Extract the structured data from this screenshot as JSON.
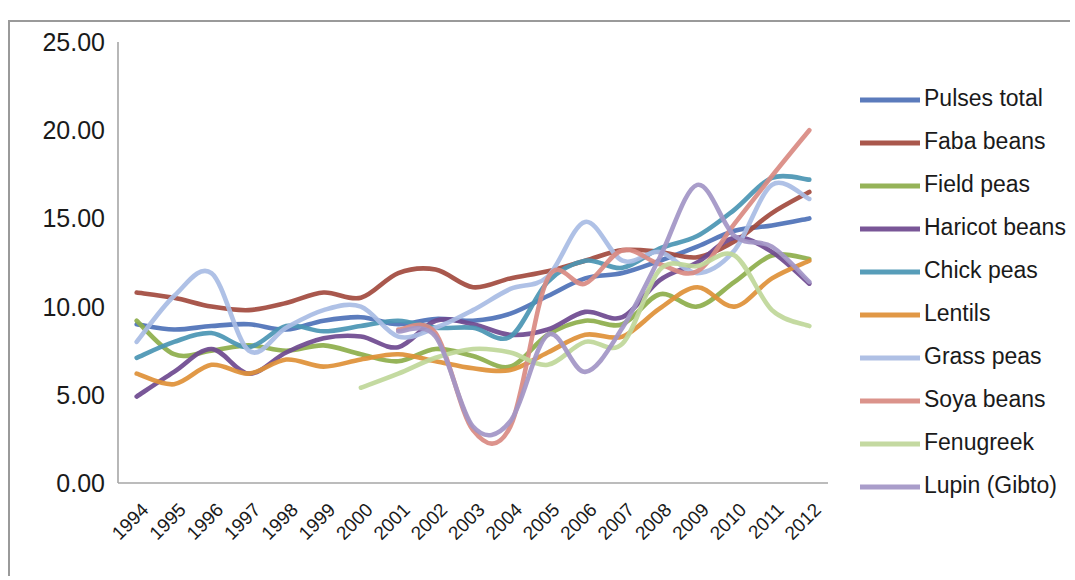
{
  "chart_data": {
    "type": "line",
    "title": "",
    "subtitle": "",
    "xlabel": "",
    "ylabel": "",
    "grid": false,
    "legend_position": "right",
    "ylim": [
      0,
      25
    ],
    "ytick_labels": [
      "0.00",
      "5.00",
      "10.00",
      "15.00",
      "20.00",
      "25.00"
    ],
    "ytick_values": [
      0,
      5,
      10,
      15,
      20,
      25
    ],
    "categories": [
      "1994",
      "1995",
      "1996",
      "1997",
      "1998",
      "1999",
      "2000",
      "2001",
      "2002",
      "2003",
      "2004",
      "2005",
      "2006",
      "2007",
      "2008",
      "2009",
      "2010",
      "2011",
      "2012"
    ],
    "series": [
      {
        "name": "Pulses total",
        "color": "#4f72b8",
        "values": [
          9.0,
          8.7,
          8.9,
          9.0,
          8.7,
          9.2,
          9.4,
          9.0,
          9.3,
          9.2,
          9.6,
          10.6,
          11.6,
          11.9,
          12.6,
          13.4,
          14.3,
          14.6,
          15.0
        ]
      },
      {
        "name": "Faba beans",
        "color": "#a34b3f",
        "values": [
          10.8,
          10.5,
          10.0,
          9.8,
          10.2,
          10.8,
          10.5,
          11.9,
          12.1,
          11.1,
          11.6,
          12.0,
          12.6,
          13.2,
          13.1,
          12.8,
          13.7,
          15.3,
          16.5
        ]
      },
      {
        "name": "Field peas",
        "color": "#8eae4c",
        "values": [
          9.2,
          7.3,
          7.5,
          7.8,
          7.5,
          7.8,
          7.3,
          6.9,
          7.6,
          7.2,
          6.6,
          8.4,
          9.2,
          9.0,
          10.7,
          10.0,
          11.4,
          12.9,
          12.7
        ]
      },
      {
        "name": "Haricot beans",
        "color": "#6f4a90"
      },
      {
        "name": "Chick peas",
        "color": "#4b96b4"
      },
      {
        "name": "Lentils",
        "color": "#df9139"
      },
      {
        "name": "Grass peas",
        "color": "#a9bce4"
      },
      {
        "name": "Soya beans",
        "color": "#d98b83"
      },
      {
        "name": "Fenugreek",
        "color": "#c0d79a"
      },
      {
        "name": "Lupin (Gibto)",
        "color": "#a396c6"
      }
    ],
    "series_values": {
      "Haricot beans": [
        4.9,
        6.3,
        7.6,
        6.2,
        7.4,
        8.2,
        8.3,
        7.7,
        9.2,
        9.0,
        8.4,
        8.7,
        9.7,
        9.4,
        11.5,
        12.5,
        13.9,
        13.1,
        11.3
      ],
      "Chick peas": [
        7.1,
        8.0,
        8.5,
        7.7,
        8.9,
        8.6,
        8.9,
        9.2,
        8.8,
        8.8,
        8.3,
        11.4,
        12.6,
        12.2,
        13.3,
        14.0,
        15.5,
        17.3,
        17.2
      ],
      "Lentils": [
        6.2,
        5.6,
        6.7,
        6.2,
        7.0,
        6.6,
        7.0,
        7.3,
        6.9,
        6.5,
        6.4,
        7.4,
        8.4,
        8.3,
        9.9,
        11.1,
        10.0,
        11.6,
        12.6
      ],
      "Grass peas": [
        8.0,
        10.6,
        11.9,
        7.5,
        8.8,
        9.8,
        10.0,
        8.3,
        8.8,
        9.8,
        11.0,
        11.7,
        14.8,
        12.6,
        13.1,
        11.9,
        13.2,
        16.9,
        16.1
      ],
      "Soya beans": [
        null,
        null,
        null,
        null,
        null,
        null,
        null,
        8.7,
        8.5,
        3.0,
        3.2,
        11.6,
        11.3,
        13.2,
        12.4,
        12.0,
        14.7,
        17.4,
        20.0
      ],
      "Fenugreek": [
        null,
        null,
        null,
        null,
        null,
        null,
        5.4,
        6.2,
        7.1,
        7.6,
        7.4,
        6.7,
        8.0,
        7.9,
        12.1,
        12.3,
        12.9,
        9.8,
        8.9
      ],
      "Lupin (Gibto)": [
        null,
        null,
        null,
        null,
        null,
        null,
        null,
        8.6,
        8.3,
        3.2,
        3.5,
        8.4,
        6.3,
        8.8,
        12.8,
        16.9,
        14.0,
        13.4,
        11.4
      ]
    }
  },
  "legend": {
    "items": [
      {
        "label": "Pulses total"
      },
      {
        "label": "Faba beans"
      },
      {
        "label": "Field peas"
      },
      {
        "label": "Haricot beans"
      },
      {
        "label": "Chick peas"
      },
      {
        "label": "Lentils"
      },
      {
        "label": "Grass peas"
      },
      {
        "label": "Soya beans"
      },
      {
        "label": "Fenugreek"
      },
      {
        "label": "Lupin (Gibto)"
      }
    ]
  }
}
